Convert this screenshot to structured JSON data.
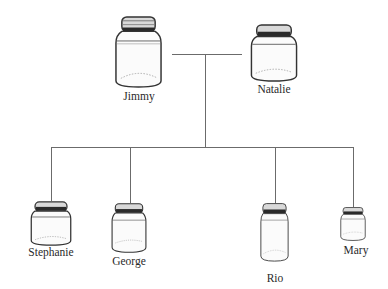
{
  "diagram": {
    "type": "family-tree",
    "line_color": "#6b6b6b",
    "parents": [
      {
        "name": "Jimmy",
        "jar": {
          "x": 114,
          "y": 16,
          "w": 49,
          "h": 72
        },
        "label": {
          "cx": 139,
          "y": 90
        }
      },
      {
        "name": "Natalie",
        "jar": {
          "x": 250,
          "y": 24,
          "w": 48,
          "h": 58
        },
        "label": {
          "cx": 274,
          "y": 83
        }
      }
    ],
    "children": [
      {
        "name": "Stephanie",
        "jar": {
          "x": 30,
          "y": 201,
          "w": 42,
          "h": 45
        },
        "label": {
          "cx": 51,
          "y": 246
        },
        "drop_x": 51
      },
      {
        "name": "George",
        "jar": {
          "x": 111,
          "y": 203,
          "w": 36,
          "h": 50
        },
        "label": {
          "cx": 129,
          "y": 255
        },
        "drop_x": 130
      },
      {
        "name": "Rio",
        "jar": {
          "x": 260,
          "y": 203,
          "w": 29,
          "h": 59
        },
        "label": {
          "cx": 275,
          "y": 272
        },
        "drop_x": 275
      },
      {
        "name": "Mary",
        "jar": {
          "x": 340,
          "y": 207,
          "w": 26,
          "h": 34
        },
        "label": {
          "cx": 356,
          "y": 244
        },
        "drop_x": 353
      }
    ],
    "connectors": {
      "marriage_line": {
        "x1": 172,
        "x2": 242,
        "y": 54
      },
      "stem": {
        "x": 205,
        "y1": 54,
        "y2": 147
      },
      "sibling_line": {
        "x1": 51,
        "x2": 353,
        "y": 147
      },
      "drops": [
        {
          "x": 51,
          "y1": 147,
          "y2": 201
        },
        {
          "x": 130,
          "y1": 147,
          "y2": 203
        },
        {
          "x": 275,
          "y1": 147,
          "y2": 203
        },
        {
          "x": 353,
          "y1": 147,
          "y2": 207
        }
      ]
    }
  }
}
